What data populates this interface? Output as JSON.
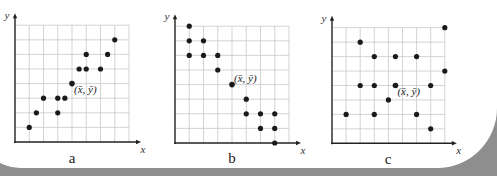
{
  "chart_data": [
    {
      "type": "scatter",
      "title": "a",
      "xlabel": "x",
      "ylabel": "y",
      "grid": true,
      "xlim": [
        0,
        8
      ],
      "ylim": [
        0,
        8
      ],
      "points": [
        [
          1,
          1
        ],
        [
          1.5,
          2
        ],
        [
          2,
          3
        ],
        [
          3,
          3
        ],
        [
          3.5,
          3
        ],
        [
          3,
          2
        ],
        [
          4.5,
          5
        ],
        [
          5,
          5
        ],
        [
          6,
          5
        ],
        [
          5,
          6
        ],
        [
          6.5,
          6
        ],
        [
          7,
          7
        ]
      ],
      "mean_point": {
        "x": 4,
        "y": 4,
        "label": "(x̄, ȳ)"
      },
      "trend": "positive correlation"
    },
    {
      "type": "scatter",
      "title": "b",
      "xlabel": "x",
      "ylabel": "y",
      "grid": true,
      "xlim": [
        0,
        8
      ],
      "ylim": [
        0,
        8
      ],
      "points": [
        [
          1,
          8
        ],
        [
          1,
          7
        ],
        [
          2,
          7
        ],
        [
          1,
          6
        ],
        [
          2,
          6
        ],
        [
          3,
          6
        ],
        [
          3,
          5
        ],
        [
          5,
          3
        ],
        [
          5,
          2
        ],
        [
          6,
          2
        ],
        [
          7,
          2
        ],
        [
          6,
          1
        ],
        [
          7,
          1
        ],
        [
          7,
          0
        ]
      ],
      "mean_point": {
        "x": 4,
        "y": 4,
        "label": "(x̄, ȳ)"
      },
      "trend": "negative correlation"
    },
    {
      "type": "scatter",
      "title": "c",
      "xlabel": "x",
      "ylabel": "y",
      "grid": true,
      "xlim": [
        0,
        8
      ],
      "ylim": [
        0,
        8
      ],
      "points": [
        [
          8,
          8
        ],
        [
          2,
          7
        ],
        [
          3,
          6
        ],
        [
          4.5,
          6
        ],
        [
          6,
          6
        ],
        [
          8,
          5
        ],
        [
          2,
          4
        ],
        [
          3,
          4
        ],
        [
          7,
          4
        ],
        [
          4,
          3
        ],
        [
          1,
          2
        ],
        [
          3,
          2
        ],
        [
          6,
          2
        ],
        [
          7,
          1
        ]
      ],
      "mean_point": {
        "x": 4.5,
        "y": 4,
        "label": "(x̄, ȳ)"
      },
      "trend": "no correlation"
    }
  ],
  "panels": [
    {
      "label": "a",
      "x_axis": "x",
      "y_axis": "y",
      "mean_label": "(x̄, ȳ)"
    },
    {
      "label": "b",
      "x_axis": "x",
      "y_axis": "y",
      "mean_label": "(x̄, ȳ)"
    },
    {
      "label": "c",
      "x_axis": "x",
      "y_axis": "y",
      "mean_label": "(x̄, ȳ)"
    }
  ],
  "style": {
    "dot_color": "#1a1a1a",
    "grid_color": "#c8c8c8",
    "axis_color": "#222222"
  }
}
